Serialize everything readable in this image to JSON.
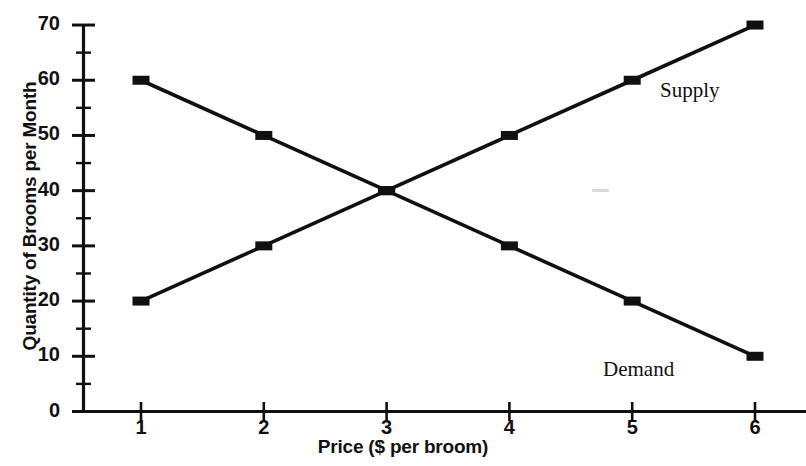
{
  "chart_data": {
    "type": "line",
    "title": "",
    "xlabel": "Price ($ per broom)",
    "ylabel": "Quantity of Brooms per Month",
    "x": [
      1,
      2,
      3,
      4,
      5,
      6
    ],
    "xlim": [
      0.5,
      6.6
    ],
    "ylim": [
      0,
      70
    ],
    "xticks": [
      "1",
      "2",
      "3",
      "4",
      "5",
      "6"
    ],
    "yticks": [
      "0",
      "10",
      "20",
      "30",
      "40",
      "50",
      "60",
      "70"
    ],
    "ytick_values": [
      0,
      10,
      20,
      30,
      40,
      50,
      60,
      70
    ],
    "yminor_values": [
      5,
      15,
      25,
      35,
      45,
      55,
      65
    ],
    "grid": false,
    "legend_position": "inline-annotation",
    "marker": "filled-square",
    "line_color": "#101010",
    "series": [
      {
        "name": "Supply",
        "values": [
          20,
          30,
          40,
          50,
          60,
          70
        ],
        "label_x": 5.5,
        "label_y": 58
      },
      {
        "name": "Demand",
        "values": [
          60,
          50,
          40,
          30,
          20,
          10
        ],
        "label_x": 5.0,
        "label_y": 8
      }
    ],
    "annotations": [
      {
        "text": "Supply",
        "x": 5.5,
        "y": 58
      },
      {
        "text": "Demand",
        "x": 5.0,
        "y": 8
      }
    ],
    "equilibrium": {
      "price": 3,
      "quantity": 40
    }
  },
  "axes": {
    "x_title": "Price ($ per broom)",
    "y_title": "Quantity of Brooms per Month"
  },
  "colors": {
    "ink": "#101010",
    "background": "#ffffff"
  }
}
